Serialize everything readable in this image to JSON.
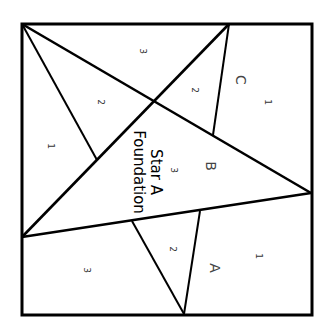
{
  "diagram": {
    "type": "paper-piecing-pattern",
    "text_rotation_deg": 90,
    "title_lines": [
      "Star A",
      "Foundation"
    ],
    "sections": [
      {
        "id": "A",
        "label": "A",
        "pieces": [
          {
            "num": "1",
            "x": 258,
            "y": 256
          },
          {
            "num": "2",
            "x": 172,
            "y": 249
          },
          {
            "num": "3",
            "x": 86,
            "y": 270
          }
        ]
      },
      {
        "id": "B",
        "label": "B",
        "pieces": [
          {
            "num": "1",
            "x": 50,
            "y": 146
          },
          {
            "num": "2",
            "x": 100,
            "y": 102
          },
          {
            "num": "3",
            "x": 173,
            "y": 170
          }
        ]
      },
      {
        "id": "C",
        "label": "C",
        "pieces": [
          {
            "num": "1",
            "x": 267,
            "y": 102
          },
          {
            "num": "2",
            "x": 194,
            "y": 90
          },
          {
            "num": "3",
            "x": 142,
            "y": 51
          }
        ]
      }
    ],
    "section_labels": {
      "A": {
        "x": 214,
        "y": 268
      },
      "B": {
        "x": 210,
        "y": 166
      },
      "C": {
        "x": 240,
        "y": 80
      }
    },
    "title_position": {
      "x": 155,
      "y": 172
    },
    "colors": {
      "line": "#000000",
      "background": "#ffffff",
      "text": "#333333"
    }
  }
}
